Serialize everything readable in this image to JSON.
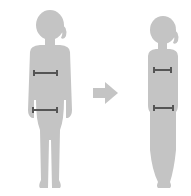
{
  "illustration": {
    "subject": "before-after-body-slimming",
    "figures": [
      {
        "name": "before-figure",
        "build": "wide",
        "measurements": [
          "chest",
          "waist"
        ]
      },
      {
        "name": "after-figure",
        "build": "slim",
        "measurements": [
          "chest",
          "waist"
        ]
      }
    ],
    "arrow": {
      "direction": "right"
    }
  },
  "colors": {
    "background": "#ffffff",
    "silhouette": "#c4c4c4",
    "measure_line": "#555555",
    "arrow": "#c4c4c4"
  }
}
